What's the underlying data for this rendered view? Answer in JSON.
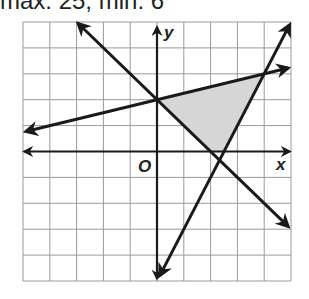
{
  "caption": "max: 25, min: 6",
  "chart_data": {
    "type": "line",
    "title": "",
    "xlabel": "x",
    "ylabel": "y",
    "origin_label": "O",
    "xlim": [
      -5,
      5
    ],
    "ylim": [
      -5,
      5
    ],
    "grid": true,
    "grid_step": 1,
    "series": [
      {
        "name": "line-shallow",
        "equation": "y = 0.25x + 2",
        "points": [
          [
            -4.9,
            0.775
          ],
          [
            4.9,
            3.225
          ]
        ]
      },
      {
        "name": "line-descending",
        "equation": "y = -x + 2",
        "points": [
          [
            -2.95,
            4.95
          ],
          [
            4.9,
            -2.9
          ]
        ]
      },
      {
        "name": "line-steep",
        "equation": "y = 2x - 5",
        "points": [
          [
            0.1,
            -4.8
          ],
          [
            4.95,
            4.9
          ]
        ]
      }
    ],
    "shaded_region": {
      "vertices": [
        [
          0,
          2
        ],
        [
          4,
          3
        ],
        [
          2.5,
          0
        ],
        [
          2,
          0
        ]
      ],
      "color": "#d6d6d6"
    },
    "colors": {
      "line": "#1a1a1a",
      "grid": "#9a9a9a",
      "shade": "#d6d6d6"
    }
  }
}
